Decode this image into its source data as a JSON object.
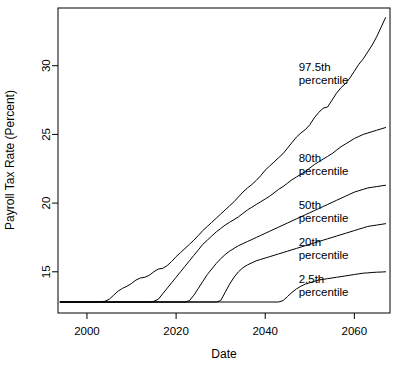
{
  "chart_data": {
    "type": "line",
    "title": "",
    "xlabel": "Date",
    "ylabel": "Payroll Tax Rate (Percent)",
    "xlim": [
      1993.5,
      2068.0
    ],
    "ylim": [
      12.0,
      34.2
    ],
    "xticks": [
      2000,
      2020,
      2040,
      2060
    ],
    "yticks": [
      15,
      20,
      25,
      30
    ],
    "xtick_labels": [
      "2000",
      "2020",
      "2040",
      "2060"
    ],
    "ytick_labels": [
      "15",
      "20",
      "25",
      "30"
    ],
    "grid": false,
    "legend_position": "inline-right",
    "baseline_value": 12.8,
    "series": [
      {
        "name": "97.5th percentile",
        "label_line1": "97.5th",
        "label_line2": "percentile",
        "label_x": 2047.5,
        "label_y": 29.6,
        "x": [
          1994,
          1998,
          2002,
          2004,
          2005,
          2006,
          2007,
          2008,
          2009,
          2010,
          2011,
          2012,
          2013,
          2014,
          2015,
          2016,
          2017,
          2018,
          2019,
          2020,
          2021,
          2022,
          2023,
          2024,
          2025,
          2026,
          2027,
          2028,
          2029,
          2030,
          2031,
          2032,
          2033,
          2034,
          2035,
          2036,
          2037,
          2038,
          2039,
          2040,
          2041,
          2042,
          2043,
          2044,
          2045,
          2046,
          2047,
          2048,
          2049,
          2050,
          2051,
          2052,
          2053,
          2054,
          2055,
          2056,
          2057,
          2058,
          2059,
          2060,
          2061,
          2062,
          2063,
          2064,
          2065,
          2066,
          2067
        ],
        "y": [
          12.8,
          12.8,
          12.8,
          12.85,
          13.0,
          13.3,
          13.6,
          13.8,
          13.95,
          14.15,
          14.4,
          14.55,
          14.6,
          14.75,
          15.0,
          15.2,
          15.25,
          15.45,
          15.75,
          16.1,
          16.4,
          16.7,
          17.0,
          17.3,
          17.65,
          18.0,
          18.3,
          18.6,
          18.9,
          19.2,
          19.5,
          19.8,
          20.1,
          20.45,
          20.8,
          21.1,
          21.35,
          21.65,
          22.0,
          22.4,
          22.7,
          23.0,
          23.3,
          23.6,
          24.0,
          24.4,
          24.8,
          25.1,
          25.35,
          25.7,
          26.2,
          26.6,
          26.9,
          27.0,
          27.5,
          28.0,
          28.4,
          28.7,
          29.1,
          29.6,
          30.1,
          30.5,
          31.0,
          31.5,
          32.1,
          32.8,
          33.5
        ]
      },
      {
        "name": "80th percentile",
        "label_line1": "80th",
        "label_line2": "percentile",
        "label_x": 2047.5,
        "label_y": 23.0,
        "x": [
          1994,
          2000,
          2008,
          2012,
          2014,
          2015,
          2016,
          2017,
          2018,
          2019,
          2020,
          2021,
          2022,
          2023,
          2024,
          2025,
          2026,
          2027,
          2028,
          2029,
          2030,
          2031,
          2032,
          2033,
          2034,
          2035,
          2036,
          2037,
          2038,
          2039,
          2040,
          2041,
          2042,
          2043,
          2044,
          2045,
          2046,
          2047,
          2048,
          2049,
          2050,
          2051,
          2052,
          2053,
          2054,
          2055,
          2056,
          2057,
          2058,
          2059,
          2060,
          2061,
          2062,
          2063,
          2064,
          2065,
          2066,
          2067
        ],
        "y": [
          12.8,
          12.8,
          12.8,
          12.8,
          12.8,
          12.85,
          13.0,
          13.4,
          13.8,
          14.2,
          14.6,
          15.0,
          15.4,
          15.8,
          16.2,
          16.6,
          17.0,
          17.3,
          17.6,
          17.9,
          18.15,
          18.4,
          18.6,
          18.8,
          19.0,
          19.25,
          19.5,
          19.7,
          19.9,
          20.1,
          20.3,
          20.5,
          20.75,
          21.0,
          21.2,
          21.45,
          21.7,
          21.9,
          22.1,
          22.3,
          22.55,
          22.8,
          23.0,
          23.2,
          23.4,
          23.6,
          23.85,
          24.1,
          24.3,
          24.5,
          24.7,
          24.85,
          25.0,
          25.1,
          25.2,
          25.3,
          25.4,
          25.5
        ]
      },
      {
        "name": "50th percentile",
        "label_line1": "50th",
        "label_line2": "percentile",
        "label_x": 2047.5,
        "label_y": 19.6,
        "x": [
          1994,
          2005,
          2015,
          2020,
          2022,
          2023,
          2024,
          2025,
          2026,
          2027,
          2028,
          2029,
          2030,
          2031,
          2032,
          2033,
          2034,
          2035,
          2036,
          2037,
          2038,
          2039,
          2040,
          2041,
          2042,
          2043,
          2044,
          2045,
          2046,
          2047,
          2048,
          2049,
          2050,
          2051,
          2052,
          2053,
          2054,
          2055,
          2056,
          2057,
          2058,
          2059,
          2060,
          2061,
          2062,
          2063,
          2064,
          2065,
          2066,
          2067
        ],
        "y": [
          12.8,
          12.8,
          12.8,
          12.8,
          12.8,
          12.9,
          13.3,
          13.8,
          14.3,
          14.8,
          15.2,
          15.6,
          15.95,
          16.25,
          16.5,
          16.7,
          16.9,
          17.05,
          17.2,
          17.35,
          17.5,
          17.65,
          17.8,
          17.95,
          18.1,
          18.25,
          18.4,
          18.55,
          18.7,
          18.85,
          19.0,
          19.15,
          19.3,
          19.45,
          19.6,
          19.75,
          19.9,
          20.05,
          20.2,
          20.35,
          20.5,
          20.65,
          20.8,
          20.9,
          21.0,
          21.1,
          21.15,
          21.2,
          21.25,
          21.3
        ]
      },
      {
        "name": "20th percentile",
        "label_line1": "20th",
        "label_line2": "percentile",
        "label_x": 2047.5,
        "label_y": 16.9,
        "x": [
          1994,
          2010,
          2025,
          2029,
          2030,
          2031,
          2032,
          2033,
          2034,
          2035,
          2036,
          2037,
          2038,
          2039,
          2040,
          2041,
          2042,
          2043,
          2044,
          2045,
          2046,
          2047,
          2048,
          2049,
          2050,
          2051,
          2052,
          2053,
          2054,
          2055,
          2056,
          2057,
          2058,
          2059,
          2060,
          2061,
          2062,
          2063,
          2064,
          2065,
          2066,
          2067
        ],
        "y": [
          12.8,
          12.8,
          12.8,
          12.8,
          12.9,
          13.5,
          14.1,
          14.6,
          15.0,
          15.3,
          15.5,
          15.65,
          15.8,
          15.9,
          16.0,
          16.1,
          16.2,
          16.3,
          16.4,
          16.5,
          16.6,
          16.7,
          16.8,
          16.9,
          17.0,
          17.1,
          17.2,
          17.3,
          17.4,
          17.5,
          17.6,
          17.7,
          17.8,
          17.9,
          18.0,
          18.1,
          18.2,
          18.3,
          18.35,
          18.4,
          18.45,
          18.5
        ]
      },
      {
        "name": "2.5th percentile",
        "label_line1": "2.5th",
        "label_line2": "percentile",
        "label_x": 2047.5,
        "label_y": 14.2,
        "x": [
          1994,
          2010,
          2030,
          2040,
          2043,
          2044,
          2045,
          2046,
          2047,
          2048,
          2049,
          2050,
          2051,
          2052,
          2053,
          2054,
          2055,
          2056,
          2057,
          2058,
          2059,
          2060,
          2061,
          2062,
          2063,
          2064,
          2065,
          2066,
          2067
        ],
        "y": [
          12.8,
          12.8,
          12.8,
          12.8,
          12.8,
          12.9,
          13.2,
          13.5,
          13.75,
          13.95,
          14.1,
          14.2,
          14.3,
          14.4,
          14.45,
          14.5,
          14.55,
          14.6,
          14.65,
          14.7,
          14.75,
          14.8,
          14.85,
          14.9,
          14.92,
          14.95,
          14.97,
          14.98,
          15.0
        ]
      }
    ]
  }
}
